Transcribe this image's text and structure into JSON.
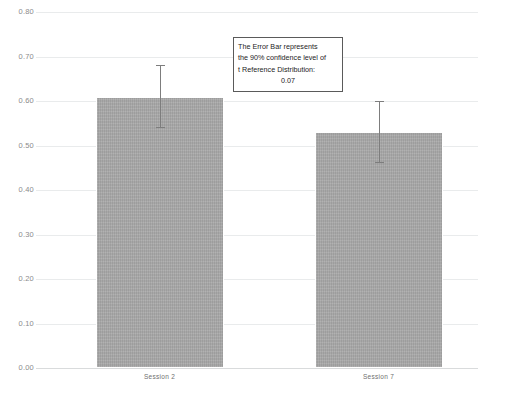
{
  "chart_data": {
    "type": "bar",
    "title": "",
    "subtitle": "",
    "xlabel": "",
    "ylabel": "",
    "categories": [
      "Session 2",
      "Session 7"
    ],
    "values": [
      0.61,
      0.53
    ],
    "errors": [
      0.07,
      0.07
    ],
    "error_type": "90% confidence level of t Reference Distribution",
    "ylim": [
      0.0,
      0.8
    ],
    "ytick_step": 0.1,
    "yticks": [
      "0.80",
      "0.70",
      "0.60",
      "0.50",
      "0.40",
      "0.30",
      "0.20",
      "0.10",
      "0.00"
    ],
    "ytick_values": [
      0.8,
      0.7,
      0.6,
      0.5,
      0.4,
      0.3,
      0.2,
      0.1,
      0.0
    ],
    "grid": true,
    "legend": "none",
    "bar_color": "#a9a9a9",
    "bar_edge_color": "#ffffff",
    "error_color": "#7d7d7d",
    "grid_color": "#e9ebec",
    "background": "#ffffff"
  },
  "annotation": {
    "line1": "The Error Bar represents",
    "line2": "the 90% confidence level of",
    "line3": "t Reference Distribution:",
    "line4": "0.07",
    "border_color": "#5a5a5a"
  }
}
